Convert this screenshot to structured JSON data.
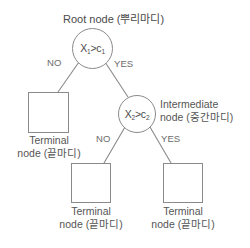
{
  "diagram": {
    "line_color": "#8a8a8a",
    "text_color": "#4a4a4a",
    "background": "#ffffff"
  },
  "labels": {
    "root_title": "Root node (뿌리마디)",
    "intermediate_title": "Intermediate\nnode (중간마디)",
    "terminal_left": "Terminal\nnode (끝마디)",
    "terminal_mid": "Terminal\nnode (끝마디)",
    "terminal_right": "Terminal\nnode (끝마디)"
  },
  "nodes": {
    "root": {
      "variable": "X",
      "var_sub": "1",
      "operator": ">",
      "threshold": "c",
      "thr_sub": "1"
    },
    "intermediate": {
      "variable": "X",
      "var_sub": "2",
      "operator": ">",
      "threshold": "c",
      "thr_sub": "2"
    }
  },
  "branches": {
    "root_no": "NO",
    "root_yes": "YES",
    "inter_no": "NO",
    "inter_yes": "YES"
  }
}
